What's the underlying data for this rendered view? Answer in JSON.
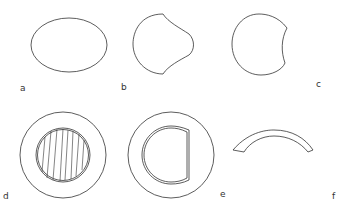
{
  "figure": {
    "panels": [
      {
        "id": "a",
        "label": "a",
        "description": "ellipse outline"
      },
      {
        "id": "b",
        "label": "b",
        "description": "rounded shape with concave notches on right"
      },
      {
        "id": "c",
        "label": "c",
        "description": "circle with concave right side"
      },
      {
        "id": "d",
        "label": "d",
        "description": "outer ring with hatched inner circle"
      },
      {
        "id": "e",
        "label": "e",
        "description": "outer ring with inner D-shaped double outline"
      },
      {
        "id": "f",
        "label": "f",
        "description": "arched curved strip"
      }
    ],
    "stroke_color": "#333333",
    "background": "#ffffff"
  }
}
